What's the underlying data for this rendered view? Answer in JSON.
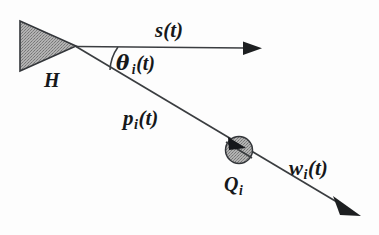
{
  "figure": {
    "background_color": "#fdfdfd",
    "ink_color": "#16181a",
    "fill_gray": "#9a9a9a"
  },
  "labels": {
    "sight_vector": {
      "name": "s",
      "arg": "(t)",
      "text": "s(t)"
    },
    "head": {
      "name": "H",
      "text": "H"
    },
    "angle": {
      "symbol": "θ",
      "sub": "i",
      "arg": "(t)",
      "text": "θ i(t)"
    },
    "position_vector": {
      "name": "p",
      "sub": "i",
      "arg": "(t)",
      "text": "p i(t)"
    },
    "target": {
      "name": "Q",
      "sub": "i",
      "text": "Q i"
    },
    "target_vector": {
      "name": "w",
      "sub": "i",
      "arg": "(t)",
      "text": "w i(t)"
    }
  },
  "shapes": {
    "head_triangle": {
      "icon": "filled-triangle-pointing-right",
      "points": "20,21 20,71 76,46",
      "fill": "#a0a0a0",
      "stroke": "#2a2a2a"
    },
    "target_circle": {
      "icon": "filled-circle",
      "cx": 239,
      "cy": 150,
      "r": 13,
      "fill": "#a8a8a8",
      "stroke": "#2a2a2a"
    },
    "sight_line": {
      "icon": "arrow-right",
      "from": [
        76,
        46
      ],
      "to": [
        260,
        48
      ]
    },
    "ray_line": {
      "icon": "arrow-down-right",
      "from": [
        76,
        46
      ],
      "to": [
        360,
        215
      ]
    },
    "angle_arc": {
      "icon": "angle-arc",
      "vertex": [
        76,
        46
      ],
      "radius": 42
    }
  }
}
